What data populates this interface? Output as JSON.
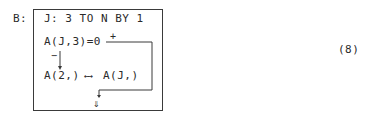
{
  "label": "B:",
  "loop_header": "J: 3 TO N BY 1",
  "condition": "A(J,3)=0",
  "plus_branch": "+",
  "minus_branch": "−",
  "swap_left": "A(2,)",
  "swap_arrow": "←→",
  "swap_right": "A(J,)",
  "exit_arrow": "⇓",
  "equation_number": "(8)"
}
